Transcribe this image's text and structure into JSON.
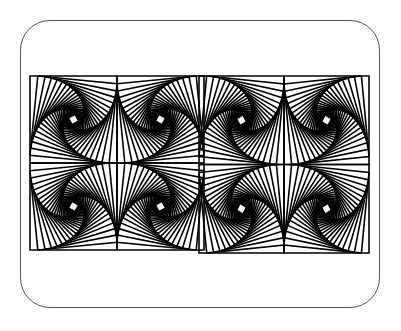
{
  "frame": {
    "x": 20,
    "y": 20,
    "width": 360,
    "height": 288,
    "radius": 30,
    "stroke": "#555555"
  },
  "artwork": {
    "description": "Two side-by-side whirl patterns of nested rotating squares",
    "stroke": "#000000",
    "stroke_width": 1.6,
    "steps": 28,
    "ratio": 0.09,
    "panels": [
      {
        "x": 30,
        "y": 76,
        "size": 174
      },
      {
        "x": 199,
        "y": 76,
        "size": 170,
        "height": 177
      }
    ]
  }
}
